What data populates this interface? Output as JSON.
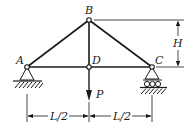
{
  "diagram": {
    "type": "truss",
    "nodes": {
      "A": {
        "label": "A"
      },
      "B": {
        "label": "B"
      },
      "C": {
        "label": "C"
      },
      "D": {
        "label": "D"
      }
    },
    "members": [
      "AB",
      "BC",
      "AD",
      "DC",
      "BD"
    ],
    "supports": {
      "A": "pin",
      "C": "roller"
    },
    "load": {
      "label": "P",
      "at": "D",
      "direction": "down"
    },
    "dimensions": {
      "height_label": "H",
      "left_span_label": "L/2",
      "right_span_label": "L/2"
    },
    "colors": {
      "line": "#1a1a1a",
      "background": "#ffffff"
    }
  }
}
